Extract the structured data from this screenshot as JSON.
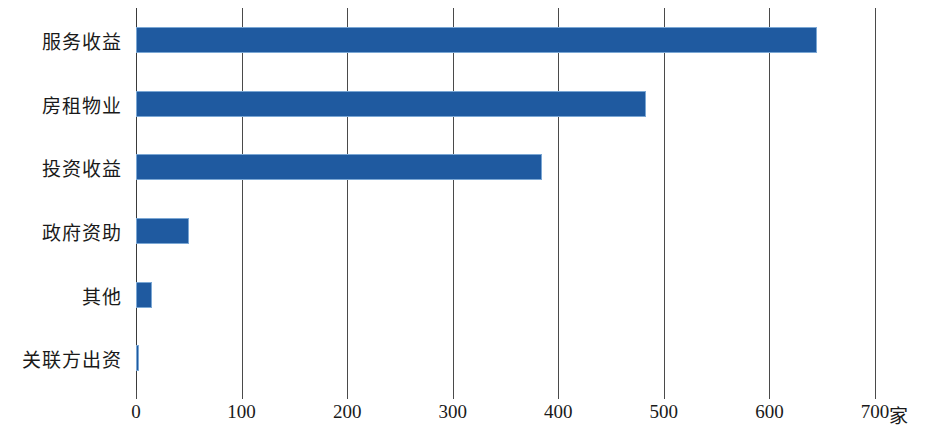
{
  "chart_data": {
    "type": "bar",
    "orientation": "horizontal",
    "title": "",
    "xlabel": "家",
    "ylabel": "",
    "categories": [
      "服务收益",
      "房租物业",
      "投资收益",
      "政府资助",
      "其他",
      "关联方出资"
    ],
    "values": [
      645,
      483,
      385,
      50,
      15,
      3
    ],
    "xlim": [
      0,
      700
    ],
    "xticks": [
      0,
      100,
      200,
      300,
      400,
      500,
      600,
      700
    ],
    "xtick_labels": [
      "0",
      "100",
      "200",
      "300",
      "400",
      "500",
      "600",
      "700"
    ],
    "grid": true,
    "grid_axis": "x",
    "legend": null,
    "bar_color": "#1f5aa0",
    "bar_edge_color": "#7ba7d4",
    "grid_color": "#4a4a4a",
    "background": "#ffffff"
  },
  "axis": {
    "unit_label": "家"
  }
}
